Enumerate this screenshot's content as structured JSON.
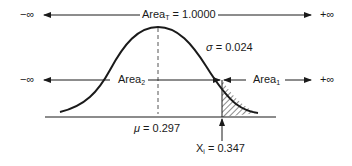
{
  "diagram": {
    "type": "normal-distribution-tail-area",
    "top_arrow": {
      "left_label": "−∞",
      "right_label": "+∞",
      "area_label": "Area",
      "area_subscript": "T",
      "area_value": "= 1.0000"
    },
    "middle_arrow": {
      "left_label": "−∞",
      "right_label": "+∞",
      "area2_label": "Area",
      "area2_subscript": "2",
      "area1_label": "Area",
      "area1_subscript": "1"
    },
    "sigma": {
      "symbol": "σ",
      "text": "= 0.024"
    },
    "mean": {
      "symbol": "μ",
      "text": "= 0.297"
    },
    "x_value": {
      "symbol": "X",
      "subscript": "i",
      "text": "= 0.347"
    },
    "colors": {
      "ink": "#1a1a1a",
      "background": "#ffffff"
    }
  }
}
